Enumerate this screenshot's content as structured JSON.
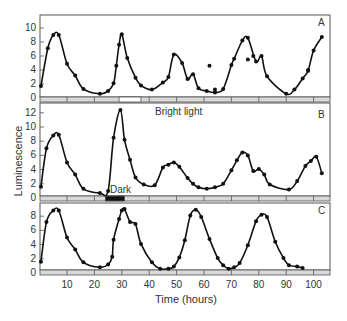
{
  "chart_data": {
    "type": "line",
    "title": "",
    "xlabel": "Time (hours)",
    "ylabel": "Luminescence",
    "x_ticks": [
      10,
      20,
      30,
      40,
      50,
      60,
      70,
      80,
      90,
      100
    ],
    "xlim": [
      0,
      106
    ],
    "grid": false,
    "panels": [
      {
        "label": "A",
        "y_ticks": [
          0,
          2,
          4,
          6,
          8,
          10
        ],
        "ylim": [
          0,
          12
        ],
        "light_bar": [
          {
            "type": "bright",
            "from": 29,
            "to": 37
          }
        ],
        "series": [
          {
            "name": "A",
            "points": [
              [
                0.5,
                1.7
              ],
              [
                3,
                7.1
              ],
              [
                5,
                9
              ],
              [
                7,
                9
              ],
              [
                10,
                4.9
              ],
              [
                13,
                3.2
              ],
              [
                16,
                1.3
              ],
              [
                22,
                0.6
              ],
              [
                25,
                1
              ],
              [
                27,
                2.1
              ],
              [
                28,
                4.6
              ],
              [
                29,
                7.6
              ],
              [
                30,
                9.1
              ],
              [
                32,
                5.7
              ],
              [
                35,
                2.9
              ],
              [
                37,
                1.8
              ],
              [
                41,
                1.2
              ],
              [
                45,
                2.2
              ],
              [
                47,
                3
              ],
              [
                49,
                6.2
              ],
              [
                52,
                5
              ],
              [
                54,
                2.7
              ],
              [
                56,
                3.4
              ],
              [
                58,
                1.4
              ],
              [
                61,
                1
              ],
              [
                64,
                0.8
              ],
              [
                67,
                1.3
              ],
              [
                70,
                4.7
              ],
              [
                71,
                5.6
              ],
              [
                74,
                8.2
              ],
              [
                76,
                8.6
              ],
              [
                79,
                5.2
              ],
              [
                81,
                6
              ],
              [
                83,
                3.1
              ],
              [
                90,
                0.6
              ],
              [
                93,
                1.2
              ],
              [
                96,
                2.8
              ],
              [
                98,
                3.9
              ],
              [
                100,
                6.8
              ],
              [
                103,
                8.7
              ]
            ]
          }
        ],
        "outliers": [
          [
            62,
            4.6
          ],
          [
            64,
            1.2
          ],
          [
            76,
            5.5
          ],
          [
            78,
            6
          ],
          [
            98,
            4
          ]
        ]
      },
      {
        "label": "B",
        "y_ticks": [
          0,
          2,
          4,
          6,
          8,
          10,
          12
        ],
        "ylim": [
          0,
          13
        ],
        "annotations": [
          "Bright light",
          "Dark"
        ],
        "light_bar": [
          {
            "type": "dark",
            "from": 24,
            "to": 31
          }
        ],
        "series": [
          {
            "name": "B",
            "points": [
              [
                0.5,
                1.6
              ],
              [
                2.5,
                7
              ],
              [
                5,
                8.8
              ],
              [
                7,
                8.9
              ],
              [
                10,
                5
              ],
              [
                13,
                3.3
              ],
              [
                16,
                1.3
              ],
              [
                22,
                0.7
              ],
              [
                25,
                1
              ],
              [
                27,
                8.5
              ],
              [
                29.5,
                12.4
              ],
              [
                31,
                8.2
              ],
              [
                33,
                5.4
              ],
              [
                35,
                2.9
              ],
              [
                38,
                1.9
              ],
              [
                42,
                1.8
              ],
              [
                45,
                4.3
              ],
              [
                47,
                4.7
              ],
              [
                49,
                5
              ],
              [
                51,
                4.4
              ],
              [
                54,
                2.8
              ],
              [
                56,
                2
              ],
              [
                58,
                1.5
              ],
              [
                61,
                1.3
              ],
              [
                64,
                1.5
              ],
              [
                67,
                2
              ],
              [
                70,
                3.9
              ],
              [
                72,
                5.3
              ],
              [
                74,
                6.4
              ],
              [
                76,
                6
              ],
              [
                78,
                3.8
              ],
              [
                80,
                4.1
              ],
              [
                82,
                3.3
              ],
              [
                84,
                1.9
              ],
              [
                91,
                1.2
              ],
              [
                94,
                2.4
              ],
              [
                97,
                4.5
              ],
              [
                99,
                5.2
              ],
              [
                101,
                5.8
              ],
              [
                103,
                3.5
              ]
            ]
          }
        ]
      },
      {
        "label": "C",
        "y_ticks": [
          0,
          2,
          4,
          6,
          8
        ],
        "ylim": [
          0,
          10
        ],
        "series": [
          {
            "name": "C",
            "points": [
              [
                0.5,
                1.6
              ],
              [
                2.5,
                7.2
              ],
              [
                5,
                8.8
              ],
              [
                7,
                8.8
              ],
              [
                10,
                5
              ],
              [
                13,
                3.3
              ],
              [
                16,
                1.5
              ],
              [
                22,
                0.8
              ],
              [
                25,
                1.2
              ],
              [
                26.5,
                2.3
              ],
              [
                27,
                4.7
              ],
              [
                29,
                7.6
              ],
              [
                30,
                8.8
              ],
              [
                31,
                9
              ],
              [
                33,
                7.2
              ],
              [
                35,
                6.9
              ],
              [
                37,
                4.1
              ],
              [
                41,
                1.5
              ],
              [
                44,
                0.6
              ],
              [
                47,
                0.6
              ],
              [
                49,
                0.9
              ],
              [
                51,
                2.2
              ],
              [
                53,
                4.6
              ],
              [
                55,
                8.1
              ],
              [
                57,
                8.9
              ],
              [
                59,
                7.9
              ],
              [
                62,
                4.8
              ],
              [
                65,
                2.1
              ],
              [
                67,
                1.1
              ],
              [
                69,
                0.6
              ],
              [
                71,
                0.8
              ],
              [
                73,
                1.4
              ],
              [
                76,
                3.9
              ],
              [
                79,
                7.3
              ],
              [
                81,
                8.2
              ],
              [
                83,
                7.9
              ],
              [
                86,
                4.4
              ],
              [
                89,
                2.1
              ],
              [
                91,
                1.1
              ],
              [
                94,
                0.9
              ],
              [
                96,
                0.7
              ]
            ]
          }
        ]
      }
    ]
  },
  "labels": {
    "ylabel": "Luminescence",
    "xlabel": "Time (hours)",
    "panel_a": "A",
    "panel_b": "B",
    "panel_c": "C",
    "bright_light": "Bright light",
    "dark": "Dark"
  }
}
